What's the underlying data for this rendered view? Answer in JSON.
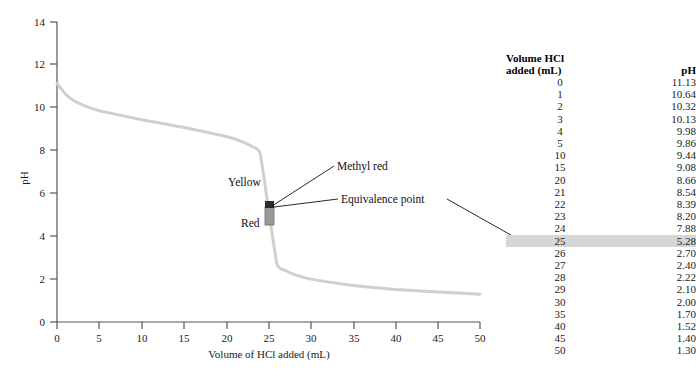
{
  "chart_data": {
    "type": "line",
    "title": "",
    "xlabel": "Volume of HCl added (mL)",
    "ylabel": "pH",
    "xlim": [
      0,
      50
    ],
    "ylim": [
      0,
      14
    ],
    "xticks": [
      0,
      5,
      10,
      15,
      20,
      25,
      30,
      35,
      40,
      45,
      50
    ],
    "yticks": [
      0,
      2,
      4,
      6,
      8,
      10,
      12,
      14
    ],
    "grid": false,
    "legend": "none",
    "series": [
      {
        "name": "Titration of weak base with HCl",
        "color": "#cfcfcf",
        "x": [
          0,
          1,
          2,
          3,
          4,
          5,
          10,
          15,
          20,
          21,
          22,
          23,
          24,
          25,
          26,
          27,
          28,
          29,
          30,
          35,
          40,
          45,
          50
        ],
        "values": [
          11.13,
          10.64,
          10.32,
          10.13,
          9.98,
          9.86,
          9.44,
          9.08,
          8.66,
          8.54,
          8.39,
          8.2,
          7.88,
          5.28,
          2.7,
          2.4,
          2.22,
          2.1,
          2.0,
          1.7,
          1.52,
          1.4,
          1.3
        ]
      }
    ],
    "annotations": [
      {
        "text": "Methyl red",
        "x": 25,
        "y": 7.1
      },
      {
        "text": "Equivalence point",
        "x": 25,
        "y": 5.28
      },
      {
        "text": "Yellow",
        "x": 21.5,
        "y": 6.4
      },
      {
        "text": "Red",
        "x": 23.3,
        "y": 4.5
      }
    ],
    "marker": {
      "name": "methyl-red-indicator-range",
      "x": 25,
      "y_low": 4.4,
      "y_high": 6.2
    }
  },
  "chart": {
    "yaxis_label": "pH",
    "xaxis_label": "Volume of HCl added (mL)",
    "xticks": [
      "0",
      "5",
      "10",
      "15",
      "20",
      "25",
      "30",
      "35",
      "40",
      "45",
      "50"
    ],
    "yticks": [
      "0",
      "2",
      "4",
      "6",
      "8",
      "10",
      "12",
      "14"
    ],
    "annotations": {
      "methyl_red": "Methyl red",
      "equivalence_point": "Equivalence point",
      "yellow": "Yellow",
      "red": "Red"
    }
  },
  "table": {
    "header": {
      "volume_line1": "Volume HCl",
      "volume_line2": "added (mL)",
      "ph": "pH"
    },
    "highlight_color": "#d6d6d6",
    "highlight_row_index": 13,
    "rows": [
      {
        "volume": "0",
        "ph": "11.13"
      },
      {
        "volume": "1",
        "ph": "10.64"
      },
      {
        "volume": "2",
        "ph": "10.32"
      },
      {
        "volume": "3",
        "ph": "10.13"
      },
      {
        "volume": "4",
        "ph": "9.98"
      },
      {
        "volume": "5",
        "ph": "9.86"
      },
      {
        "volume": "10",
        "ph": "9.44"
      },
      {
        "volume": "15",
        "ph": "9.08"
      },
      {
        "volume": "20",
        "ph": "8.66"
      },
      {
        "volume": "21",
        "ph": "8.54"
      },
      {
        "volume": "22",
        "ph": "8.39"
      },
      {
        "volume": "23",
        "ph": "8.20"
      },
      {
        "volume": "24",
        "ph": "7.88"
      },
      {
        "volume": "25",
        "ph": "5.28"
      },
      {
        "volume": "26",
        "ph": "2.70"
      },
      {
        "volume": "27",
        "ph": "2.40"
      },
      {
        "volume": "28",
        "ph": "2.22"
      },
      {
        "volume": "29",
        "ph": "2.10"
      },
      {
        "volume": "30",
        "ph": "2.00"
      },
      {
        "volume": "35",
        "ph": "1.70"
      },
      {
        "volume": "40",
        "ph": "1.52"
      },
      {
        "volume": "45",
        "ph": "1.40"
      },
      {
        "volume": "50",
        "ph": "1.30"
      }
    ]
  }
}
